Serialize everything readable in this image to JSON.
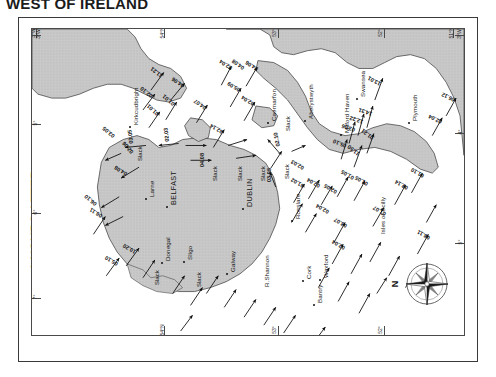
{
  "title": "WEST OF IRELAND",
  "caption": {
    "line1": "6 HOURS AFTER",
    "line2": "HW DOVER"
  },
  "compass": {
    "north_label": "N",
    "icon": "compass-rose-icon"
  },
  "graticule": {
    "top_labels": [
      "3°W",
      "54°N",
      "53°",
      "52°",
      "51°N"
    ],
    "bottom_labels": [
      "54°N",
      "53°",
      "52°"
    ],
    "left_labels": [
      "3°W",
      "5°",
      "6°",
      "7°"
    ],
    "right_labels": [
      "3°W",
      "4°",
      "5°"
    ]
  },
  "places": [
    {
      "name": "Kirkcudbright",
      "x": 100,
      "y": 96,
      "major": false,
      "dot": true
    },
    {
      "name": "Larne",
      "x": 116,
      "y": 168,
      "major": false,
      "dot": true
    },
    {
      "name": "BELFAST",
      "x": 137,
      "y": 176,
      "major": true,
      "dot": true
    },
    {
      "name": "DUBLIN",
      "x": 213,
      "y": 178,
      "major": true,
      "dot": true
    },
    {
      "name": "Caernarfon",
      "x": 238,
      "y": 92,
      "major": false,
      "dot": true
    },
    {
      "name": "Aberystwyth",
      "x": 275,
      "y": 90,
      "major": false,
      "dot": true
    },
    {
      "name": "Milford Haven",
      "x": 311,
      "y": 104,
      "major": false,
      "dot": true
    },
    {
      "name": "Swansea",
      "x": 327,
      "y": 68,
      "major": false,
      "dot": true
    },
    {
      "name": "Plymouth",
      "x": 379,
      "y": 92,
      "major": false,
      "dot": true
    },
    {
      "name": "Rosslare",
      "x": 262,
      "y": 190,
      "major": false,
      "dot": true
    },
    {
      "name": "Wexford",
      "x": 290,
      "y": 249,
      "major": false,
      "dot": true
    },
    {
      "name": "Cork",
      "x": 273,
      "y": 250,
      "major": false,
      "dot": true
    },
    {
      "name": "Bantry",
      "x": 284,
      "y": 274,
      "major": false,
      "dot": true
    },
    {
      "name": "R.Shannon",
      "x": 231,
      "y": 258,
      "major": false,
      "dot": false
    },
    {
      "name": "Galway",
      "x": 197,
      "y": 243,
      "major": false,
      "dot": true
    },
    {
      "name": "Sligo",
      "x": 154,
      "y": 231,
      "major": false,
      "dot": true
    },
    {
      "name": "Donegal",
      "x": 132,
      "y": 232,
      "major": false,
      "dot": true
    },
    {
      "name": "Isles of Scilly",
      "x": 347,
      "y": 205,
      "major": false,
      "dot": false
    }
  ],
  "slack_labels": [
    {
      "text": "Slack",
      "x": 105,
      "y": 132
    },
    {
      "text": "Slack",
      "x": 122,
      "y": 256
    },
    {
      "text": "Slack",
      "x": 164,
      "y": 258
    },
    {
      "text": "Slack",
      "x": 180,
      "y": 152
    },
    {
      "text": "Slack",
      "x": 205,
      "y": 152
    },
    {
      "text": "Slack",
      "x": 228,
      "y": 152
    },
    {
      "text": "Slack",
      "x": 252,
      "y": 150
    },
    {
      "text": "Slack",
      "x": 253,
      "y": 102
    }
  ],
  "rates": [
    {
      "value": "11.21",
      "x": 128,
      "y": 50,
      "rot": -52
    },
    {
      "value": "02.10",
      "x": 118,
      "y": 70,
      "rot": -52
    },
    {
      "value": "04.06",
      "x": 150,
      "y": 60,
      "rot": -56
    },
    {
      "value": "01.01",
      "x": 140,
      "y": 78,
      "rot": -50
    },
    {
      "value": "01.01",
      "x": 124,
      "y": 88,
      "rot": -48
    },
    {
      "value": "04.07",
      "x": 172,
      "y": 82,
      "rot": -55
    },
    {
      "value": "02.04",
      "x": 198,
      "y": 42,
      "rot": -58
    },
    {
      "value": "04.06",
      "x": 224,
      "y": 43,
      "rot": -58
    },
    {
      "value": "05.09",
      "x": 206,
      "y": 64,
      "rot": -58
    },
    {
      "value": "02.04",
      "x": 220,
      "y": 78,
      "rot": -58
    },
    {
      "value": "04.08",
      "x": 210,
      "y": 42,
      "rot": -55
    },
    {
      "value": "02.14",
      "x": 189,
      "y": 106,
      "rot": -60
    },
    {
      "value": "03.05",
      "x": 96,
      "y": 115,
      "rot": -6
    },
    {
      "value": "02.03",
      "x": 132,
      "y": 113,
      "rot": -6
    },
    {
      "value": "03.05",
      "x": 80,
      "y": 110,
      "rot": -50
    },
    {
      "value": "02.06",
      "x": 98,
      "y": 126,
      "rot": -40
    },
    {
      "value": "04.08",
      "x": 93,
      "y": 148,
      "rot": -58
    },
    {
      "value": "06.10",
      "x": 62,
      "y": 178,
      "rot": -50
    },
    {
      "value": "02.10",
      "x": 243,
      "y": 118,
      "rot": -12
    },
    {
      "value": "03.05",
      "x": 234,
      "y": 153,
      "rot": 0
    },
    {
      "value": "04.08",
      "x": 167,
      "y": 138,
      "rot": 0
    },
    {
      "value": "02.04",
      "x": 286,
      "y": 160,
      "rot": -60
    },
    {
      "value": "01.02",
      "x": 270,
      "y": 160,
      "rot": -60
    },
    {
      "value": "02.03",
      "x": 270,
      "y": 142,
      "rot": -60
    },
    {
      "value": "02.04",
      "x": 295,
      "y": 186,
      "rot": -60
    },
    {
      "value": "02.05",
      "x": 303,
      "y": 166,
      "rot": -60
    },
    {
      "value": "01.05",
      "x": 320,
      "y": 152,
      "rot": -60
    },
    {
      "value": "01.05",
      "x": 334,
      "y": 158,
      "rot": -60
    },
    {
      "value": "01.07",
      "x": 352,
      "y": 188,
      "rot": -60
    },
    {
      "value": "02.14",
      "x": 374,
      "y": 162,
      "rot": -60
    },
    {
      "value": "01.10",
      "x": 390,
      "y": 150,
      "rot": -60
    },
    {
      "value": "08.11",
      "x": 396,
      "y": 212,
      "rot": -60
    },
    {
      "value": "03.07",
      "x": 313,
      "y": 200,
      "rot": -60
    },
    {
      "value": "02.04",
      "x": 311,
      "y": 222,
      "rot": -60
    },
    {
      "value": "02.03",
      "x": 305,
      "y": 320,
      "rot": -4
    },
    {
      "value": "01.21",
      "x": 339,
      "y": 112,
      "rot": -52
    },
    {
      "value": "11.50",
      "x": 325,
      "y": 128,
      "rot": -52
    },
    {
      "value": "05.10",
      "x": 313,
      "y": 120,
      "rot": -68
    },
    {
      "value": "03.06",
      "x": 322,
      "y": 104,
      "rot": -72
    },
    {
      "value": "12.22",
      "x": 330,
      "y": 96,
      "rot": -72
    },
    {
      "value": "14.31",
      "x": 339,
      "y": 88,
      "rot": -72
    },
    {
      "value": "13.01",
      "x": 347,
      "y": 58,
      "rot": -62
    },
    {
      "value": "02.04",
      "x": 408,
      "y": 96,
      "rot": -64
    },
    {
      "value": "06.12",
      "x": 421,
      "y": 74,
      "rot": -64
    },
    {
      "value": "05.10",
      "x": 84,
      "y": 238,
      "rot": -60
    },
    {
      "value": "10.20",
      "x": 102,
      "y": 226,
      "rot": -60
    },
    {
      "value": "06.11",
      "x": 68,
      "y": 190,
      "rot": -58
    }
  ],
  "arrows": [
    {
      "x1": 120,
      "y1": 62,
      "x2": 133,
      "y2": 44
    },
    {
      "x1": 112,
      "y1": 82,
      "x2": 124,
      "y2": 66
    },
    {
      "x1": 140,
      "y1": 72,
      "x2": 154,
      "y2": 55
    },
    {
      "x1": 135,
      "y1": 92,
      "x2": 146,
      "y2": 74
    },
    {
      "x1": 118,
      "y1": 100,
      "x2": 129,
      "y2": 84
    },
    {
      "x1": 166,
      "y1": 95,
      "x2": 177,
      "y2": 77
    },
    {
      "x1": 191,
      "y1": 57,
      "x2": 201,
      "y2": 38
    },
    {
      "x1": 216,
      "y1": 58,
      "x2": 227,
      "y2": 39
    },
    {
      "x1": 200,
      "y1": 79,
      "x2": 211,
      "y2": 60
    },
    {
      "x1": 214,
      "y1": 93,
      "x2": 225,
      "y2": 74
    },
    {
      "x1": 183,
      "y1": 120,
      "x2": 194,
      "y2": 102
    },
    {
      "x1": 155,
      "y1": 118,
      "x2": 176,
      "y2": 118
    },
    {
      "x1": 198,
      "y1": 118,
      "x2": 217,
      "y2": 112
    },
    {
      "x1": 160,
      "y1": 133,
      "x2": 181,
      "y2": 133
    },
    {
      "x1": 206,
      "y1": 131,
      "x2": 226,
      "y2": 128
    },
    {
      "x1": 115,
      "y1": 118,
      "x2": 94,
      "y2": 120
    },
    {
      "x1": 148,
      "y1": 116,
      "x2": 128,
      "y2": 118
    },
    {
      "x1": 90,
      "y1": 126,
      "x2": 74,
      "y2": 133
    },
    {
      "x1": 108,
      "y1": 140,
      "x2": 90,
      "y2": 151
    },
    {
      "x1": 88,
      "y1": 170,
      "x2": 70,
      "y2": 181
    },
    {
      "x1": 92,
      "y1": 190,
      "x2": 74,
      "y2": 199
    },
    {
      "x1": 250,
      "y1": 126,
      "x2": 238,
      "y2": 112
    },
    {
      "x1": 241,
      "y1": 141,
      "x2": 252,
      "y2": 124
    },
    {
      "x1": 262,
      "y1": 124,
      "x2": 276,
      "y2": 118
    },
    {
      "x1": 246,
      "y1": 160,
      "x2": 240,
      "y2": 145
    },
    {
      "x1": 279,
      "y1": 172,
      "x2": 290,
      "y2": 153
    },
    {
      "x1": 264,
      "y1": 176,
      "x2": 275,
      "y2": 157
    },
    {
      "x1": 292,
      "y1": 178,
      "x2": 303,
      "y2": 159
    },
    {
      "x1": 308,
      "y1": 170,
      "x2": 319,
      "y2": 150
    },
    {
      "x1": 325,
      "y1": 174,
      "x2": 336,
      "y2": 154
    },
    {
      "x1": 344,
      "y1": 200,
      "x2": 355,
      "y2": 181
    },
    {
      "x1": 366,
      "y1": 178,
      "x2": 377,
      "y2": 158
    },
    {
      "x1": 383,
      "y1": 166,
      "x2": 394,
      "y2": 146
    },
    {
      "x1": 389,
      "y1": 228,
      "x2": 400,
      "y2": 208
    },
    {
      "x1": 305,
      "y1": 216,
      "x2": 316,
      "y2": 196
    },
    {
      "x1": 303,
      "y1": 238,
      "x2": 314,
      "y2": 218
    },
    {
      "x1": 322,
      "y1": 248,
      "x2": 333,
      "y2": 228
    },
    {
      "x1": 341,
      "y1": 236,
      "x2": 352,
      "y2": 216
    },
    {
      "x1": 360,
      "y1": 250,
      "x2": 371,
      "y2": 230
    },
    {
      "x1": 377,
      "y1": 262,
      "x2": 388,
      "y2": 242
    },
    {
      "x1": 289,
      "y1": 262,
      "x2": 300,
      "y2": 242
    },
    {
      "x1": 309,
      "y1": 276,
      "x2": 320,
      "y2": 256
    },
    {
      "x1": 330,
      "y1": 288,
      "x2": 341,
      "y2": 268
    },
    {
      "x1": 262,
      "y1": 196,
      "x2": 273,
      "y2": 177
    },
    {
      "x1": 276,
      "y1": 206,
      "x2": 287,
      "y2": 187
    },
    {
      "x1": 338,
      "y1": 126,
      "x2": 345,
      "y2": 106
    },
    {
      "x1": 325,
      "y1": 140,
      "x2": 333,
      "y2": 118
    },
    {
      "x1": 312,
      "y1": 132,
      "x2": 318,
      "y2": 112
    },
    {
      "x1": 320,
      "y1": 116,
      "x2": 326,
      "y2": 94
    },
    {
      "x1": 329,
      "y1": 108,
      "x2": 335,
      "y2": 86
    },
    {
      "x1": 338,
      "y1": 100,
      "x2": 344,
      "y2": 78
    },
    {
      "x1": 346,
      "y1": 72,
      "x2": 354,
      "y2": 50
    },
    {
      "x1": 404,
      "y1": 108,
      "x2": 414,
      "y2": 90
    },
    {
      "x1": 418,
      "y1": 88,
      "x2": 428,
      "y2": 70
    },
    {
      "x1": 75,
      "y1": 250,
      "x2": 88,
      "y2": 232
    },
    {
      "x1": 95,
      "y1": 240,
      "x2": 108,
      "y2": 222
    },
    {
      "x1": 112,
      "y1": 252,
      "x2": 124,
      "y2": 234
    },
    {
      "x1": 62,
      "y1": 208,
      "x2": 74,
      "y2": 190
    },
    {
      "x1": 142,
      "y1": 268,
      "x2": 154,
      "y2": 250
    },
    {
      "x1": 160,
      "y1": 280,
      "x2": 172,
      "y2": 262
    },
    {
      "x1": 176,
      "y1": 268,
      "x2": 188,
      "y2": 250
    },
    {
      "x1": 194,
      "y1": 282,
      "x2": 206,
      "y2": 264
    },
    {
      "x1": 214,
      "y1": 292,
      "x2": 226,
      "y2": 274
    },
    {
      "x1": 234,
      "y1": 300,
      "x2": 246,
      "y2": 282
    },
    {
      "x1": 254,
      "y1": 308,
      "x2": 266,
      "y2": 290
    },
    {
      "x1": 284,
      "y1": 318,
      "x2": 296,
      "y2": 302
    },
    {
      "x1": 150,
      "y1": 306,
      "x2": 162,
      "y2": 290
    },
    {
      "x1": 348,
      "y1": 268,
      "x2": 358,
      "y2": 252
    },
    {
      "x1": 398,
      "y1": 196,
      "x2": 408,
      "y2": 178
    }
  ]
}
